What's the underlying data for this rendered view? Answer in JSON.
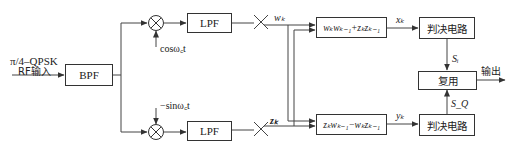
{
  "input": {
    "line1": "π/4–QPSK",
    "line2": "RF输入"
  },
  "blocks": {
    "bpf": "BPF",
    "lpf_top": "LPF",
    "lpf_bottom": "LPF",
    "formula_top": "wₖwₖ₋₁+zₖzₖ₋₁",
    "formula_bottom": "zₖwₖ₋₁−wₖzₖ₋₁",
    "decision_top": "判决电路",
    "decision_bottom": "判决电路",
    "mux": "复用"
  },
  "signals": {
    "carrier_cos": "cosω꜀t",
    "carrier_sin": "−sinω꜀t",
    "w_k": "wₖ",
    "z_k": "zₖ",
    "x_k": "xₖ",
    "y_k": "yₖ",
    "s_i": "Sᵢ",
    "s_q": "S_Q",
    "output": "输出"
  }
}
